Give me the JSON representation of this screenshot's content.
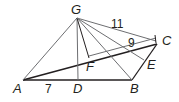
{
  "diagram": {
    "type": "geometry-figure",
    "colors": {
      "stroke_dark": "#231f20",
      "stroke_light": "#6d6e71",
      "background": "#ffffff"
    },
    "points": {
      "G": {
        "label": "G",
        "x": 77,
        "y": 18
      },
      "A": {
        "label": "A",
        "x": 23,
        "y": 80
      },
      "D": {
        "label": "D",
        "x": 78,
        "y": 80
      },
      "B": {
        "label": "B",
        "x": 132,
        "y": 80
      },
      "C": {
        "label": "C",
        "x": 157,
        "y": 44
      },
      "E": {
        "label": "E",
        "x": 144,
        "y": 60
      },
      "F": {
        "label": "F",
        "x": 89,
        "y": 58
      }
    },
    "measures": {
      "AD": "7",
      "GC": "11",
      "FC": "9"
    }
  }
}
